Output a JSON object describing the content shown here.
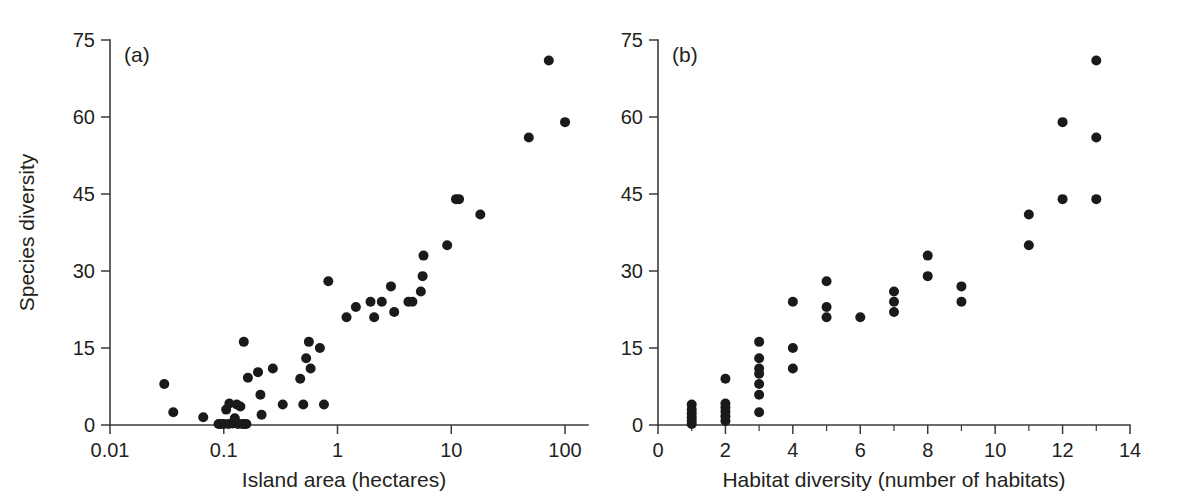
{
  "figure": {
    "background_color": "#ffffff",
    "point_color": "#1a1a1a",
    "axis_color": "#3a3a3a",
    "text_color": "#231f20"
  },
  "chart_data": [
    {
      "type": "scatter",
      "panel_label": "(a)",
      "title": "",
      "xlabel": "Island area (hectares)",
      "ylabel": "Species diversity",
      "xscale": "log",
      "yscale": "linear",
      "xlim": [
        0.01,
        130
      ],
      "ylim": [
        0,
        75
      ],
      "xticks": [
        0.01,
        0.1,
        1,
        10,
        100
      ],
      "xtick_labels": [
        "0.01",
        "0.1",
        "1",
        "10",
        "100"
      ],
      "yticks": [
        0,
        15,
        30,
        45,
        60,
        75
      ],
      "ytick_labels": [
        "0",
        "15",
        "30",
        "45",
        "60",
        "75"
      ],
      "grid": false,
      "legend": "none",
      "points": [
        [
          0.03,
          8.0
        ],
        [
          0.036,
          2.5
        ],
        [
          0.066,
          1.5
        ],
        [
          0.09,
          0.2
        ],
        [
          0.094,
          0.2
        ],
        [
          0.1,
          0.2
        ],
        [
          0.105,
          3.0
        ],
        [
          0.11,
          0.2
        ],
        [
          0.112,
          4.2
        ],
        [
          0.12,
          0.3
        ],
        [
          0.125,
          1.3
        ],
        [
          0.13,
          4.0
        ],
        [
          0.133,
          0.2
        ],
        [
          0.14,
          3.6
        ],
        [
          0.145,
          0.2
        ],
        [
          0.15,
          16.2
        ],
        [
          0.152,
          0.2
        ],
        [
          0.158,
          0.2
        ],
        [
          0.163,
          9.2
        ],
        [
          0.2,
          10.3
        ],
        [
          0.21,
          5.9
        ],
        [
          0.215,
          2.0
        ],
        [
          0.27,
          11.0
        ],
        [
          0.33,
          4.0
        ],
        [
          0.47,
          9.0
        ],
        [
          0.5,
          4.0
        ],
        [
          0.53,
          13.0
        ],
        [
          0.56,
          16.2
        ],
        [
          0.58,
          11.0
        ],
        [
          0.7,
          15.0
        ],
        [
          0.76,
          4.0
        ],
        [
          0.83,
          28.0
        ],
        [
          1.2,
          21.0
        ],
        [
          1.45,
          23.0
        ],
        [
          1.95,
          24.0
        ],
        [
          2.1,
          21.0
        ],
        [
          2.45,
          24.0
        ],
        [
          2.95,
          27.0
        ],
        [
          3.15,
          22.0
        ],
        [
          4.2,
          24.0
        ],
        [
          4.55,
          24.0
        ],
        [
          5.4,
          26.0
        ],
        [
          5.6,
          29.0
        ],
        [
          5.7,
          33.0
        ],
        [
          9.2,
          35.0
        ],
        [
          11.0,
          44.0
        ],
        [
          11.7,
          44.0
        ],
        [
          18.0,
          41.0
        ],
        [
          48.0,
          56.0
        ],
        [
          72.0,
          71.0
        ],
        [
          100.0,
          59.0
        ]
      ]
    },
    {
      "type": "scatter",
      "panel_label": "(b)",
      "title": "",
      "xlabel": "Habitat diversity (number of habitats)",
      "ylabel": "Species diversity",
      "xscale": "linear",
      "yscale": "linear",
      "xlim": [
        0,
        14
      ],
      "ylim": [
        0,
        75
      ],
      "xticks": [
        0,
        2,
        4,
        6,
        8,
        10,
        12,
        14
      ],
      "xtick_labels": [
        "0",
        "2",
        "4",
        "6",
        "8",
        "10",
        "12",
        "14"
      ],
      "xminorticks": [
        1,
        3,
        5,
        7,
        9,
        11,
        13
      ],
      "yticks": [
        0,
        15,
        30,
        45,
        60,
        75
      ],
      "ytick_labels": [
        "0",
        "15",
        "30",
        "45",
        "60",
        "75"
      ],
      "grid": false,
      "legend": "none",
      "points": [
        [
          1,
          0.2
        ],
        [
          1,
          0.8
        ],
        [
          1,
          1.5
        ],
        [
          1,
          2.3
        ],
        [
          1,
          3.0
        ],
        [
          1,
          4.0
        ],
        [
          2,
          0.8
        ],
        [
          2,
          1.7
        ],
        [
          2,
          2.6
        ],
        [
          2,
          3.4
        ],
        [
          2,
          4.2
        ],
        [
          2,
          9.0
        ],
        [
          3,
          2.5
        ],
        [
          3,
          5.9
        ],
        [
          3,
          8.0
        ],
        [
          3,
          10.0
        ],
        [
          3,
          11.0
        ],
        [
          3,
          13.0
        ],
        [
          3,
          16.2
        ],
        [
          4,
          11.0
        ],
        [
          4,
          15.0
        ],
        [
          4,
          24.0
        ],
        [
          5,
          21.0
        ],
        [
          5,
          23.0
        ],
        [
          5,
          28.0
        ],
        [
          6,
          21.0
        ],
        [
          7,
          22.0
        ],
        [
          7,
          24.0
        ],
        [
          7,
          26.0
        ],
        [
          8,
          29.0
        ],
        [
          8,
          33.0
        ],
        [
          9,
          24.0
        ],
        [
          9,
          27.0
        ],
        [
          11,
          35.0
        ],
        [
          11,
          41.0
        ],
        [
          12,
          44.0
        ],
        [
          12,
          59.0
        ],
        [
          13,
          44.0
        ],
        [
          13,
          56.0
        ],
        [
          13,
          71.0
        ]
      ]
    }
  ]
}
